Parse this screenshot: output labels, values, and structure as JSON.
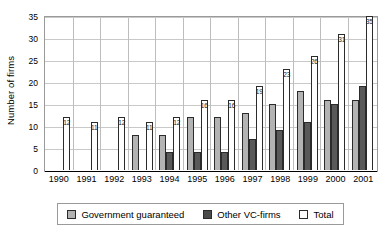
{
  "chart_data": {
    "type": "bar",
    "title": "",
    "xlabel": "",
    "ylabel": "Number of firms",
    "ylim": [
      0,
      35
    ],
    "ytick_step": 5,
    "yticks": [
      0,
      5,
      10,
      15,
      20,
      25,
      30,
      35
    ],
    "grid": true,
    "legend_position": "bottom",
    "categories": [
      "1990",
      "1991",
      "1992",
      "1993",
      "1994",
      "1995",
      "1996",
      "1997",
      "1998",
      "1999",
      "2000",
      "2001"
    ],
    "series": [
      {
        "name": "Government guaranteed",
        "color": "#b3b3b3",
        "values": [
          0,
          0,
          0,
          8,
          8,
          12,
          12,
          13,
          15,
          18,
          16,
          16
        ]
      },
      {
        "name": "Other VC-firms",
        "color": "#595959",
        "values": [
          0,
          0,
          0,
          0,
          4,
          4,
          4,
          7,
          9,
          11,
          15,
          19
        ]
      },
      {
        "name": "Total",
        "color": "#ffffff",
        "values": [
          12,
          11,
          12,
          11,
          12,
          16,
          16,
          19,
          23,
          26,
          31,
          35
        ],
        "data_labels": [
          "12",
          "11",
          "12",
          "11",
          "12",
          "16",
          "16",
          "19",
          "23",
          "26",
          "31",
          "35"
        ]
      }
    ]
  },
  "legend": {
    "items": [
      {
        "label": "Government guaranteed",
        "swatch": "gov"
      },
      {
        "label": "Other VC-firms",
        "swatch": "vc"
      },
      {
        "label": "Total",
        "swatch": "total"
      }
    ]
  },
  "axis": {
    "y_title": "Number of firms"
  }
}
